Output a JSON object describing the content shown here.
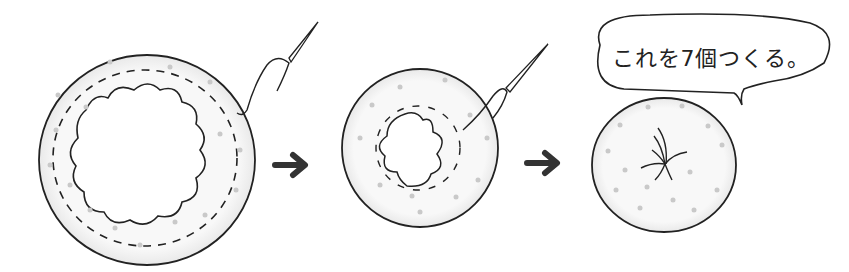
{
  "diagram": {
    "steps": [
      {
        "id": "step-1",
        "description": "fabric circle with wavy inner cutout, running stitch around edge, needle and thread"
      },
      {
        "id": "step-2",
        "description": "thread pulled to gather the circle, opening shrinks"
      },
      {
        "id": "step-3",
        "description": "completed gathered yo-yo with stitches at center"
      }
    ],
    "arrows": 2,
    "speech_bubble": {
      "text": "これを7個つくる。"
    },
    "colors": {
      "outline": "#222222",
      "fabric": "#f7f7f7",
      "dots": "#c4c4c4",
      "arrow": "#333333",
      "shadow": "#e2e2e2"
    }
  }
}
